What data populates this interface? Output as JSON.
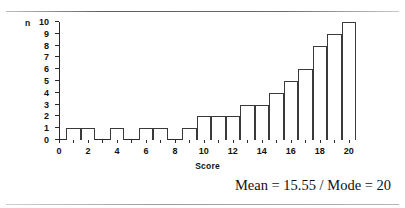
{
  "chart_data": {
    "type": "bar",
    "title": "",
    "xlabel": "Score",
    "ylabel": "n",
    "xlim": [
      0,
      20.5
    ],
    "ylim": [
      0,
      10
    ],
    "grid": false,
    "legend": null,
    "x_tick_step": 1,
    "x_label_step": 2,
    "y_tick_step": 1,
    "x_tick_labels": [
      "0",
      "2",
      "4",
      "6",
      "8",
      "10",
      "12",
      "14",
      "16",
      "18",
      "20"
    ],
    "y_tick_labels": [
      "0",
      "1",
      "2",
      "3",
      "4",
      "5",
      "6",
      "7",
      "8",
      "9",
      "10"
    ],
    "categories": [
      0,
      1,
      2,
      3,
      4,
      5,
      6,
      7,
      8,
      9,
      10,
      11,
      12,
      13,
      14,
      15,
      16,
      17,
      18,
      19,
      20
    ],
    "values": [
      0,
      1,
      1,
      0,
      1,
      0,
      1,
      1,
      0,
      1,
      2,
      2,
      2,
      3,
      3,
      4,
      5,
      6,
      8,
      9,
      10
    ],
    "bar_width": 1,
    "bar_fill": "#ffffff",
    "bar_edge": "#3a3a3a",
    "annotations": [
      "Mean = 15.55 / Mode = 20"
    ]
  },
  "caption": {
    "stats_text": "Mean = 15.55 / Mode = 20"
  }
}
